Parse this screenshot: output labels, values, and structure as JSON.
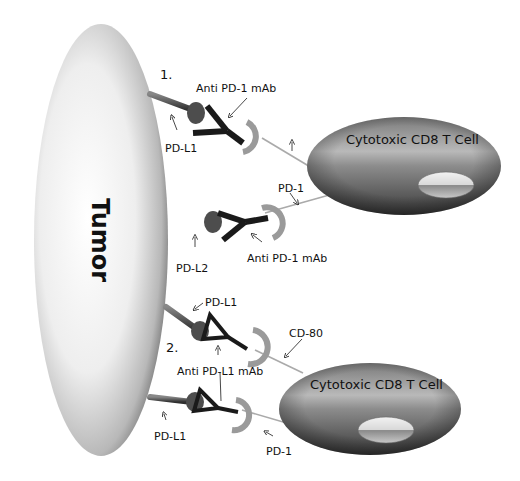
{
  "tumor": {
    "label": "Tumor"
  },
  "panels": [
    {
      "number": "1."
    },
    {
      "number": "2."
    }
  ],
  "t_cells": [
    {
      "label": "Cytotoxic CD8 T Cell"
    },
    {
      "label": "Cytotoxic CD8 T Cell"
    }
  ],
  "labels": {
    "anti_pd1_top": "Anti PD-1 mAb",
    "pdl1_top": "PD-L1",
    "pd1_mid": "PD-1",
    "pdl2": "PD-L2",
    "anti_pd1_mid": "Anti PD-1 mAb",
    "pdl1_lower": "PD-L1",
    "cd80": "CD-80",
    "anti_pdl1": "Anti PD-L1 mAb",
    "pdl1_bottom": "PD-L1",
    "pd1_bottom": "PD-1"
  },
  "colors": {
    "tumor_light": "#ffffff",
    "tumor_dark": "#8a8a8a",
    "cell_light": "#b5b5b5",
    "cell_dark": "#3a3a3a",
    "antibody": "#1a1a1a",
    "ligand": "#555555",
    "receptor": "#a9a9a9"
  }
}
